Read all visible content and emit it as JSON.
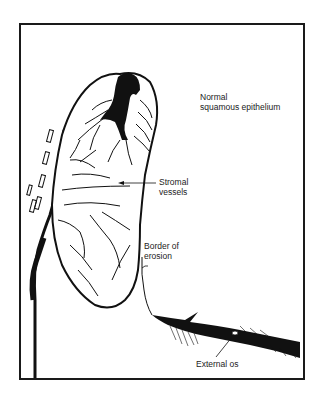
{
  "diagram": {
    "labels": {
      "normal_epithelium_line1": "Normal",
      "normal_epithelium_line2": "squamous epithelium",
      "stromal_vessels_line1": "Stromal",
      "stromal_vessels_line2": "vessels",
      "border_of_erosion_line1": "Border of",
      "border_of_erosion_line2": "erosion",
      "external_os": "External os"
    },
    "colors": {
      "ink": "#111111",
      "background": "#ffffff",
      "frame": "#1a1a1a"
    }
  }
}
